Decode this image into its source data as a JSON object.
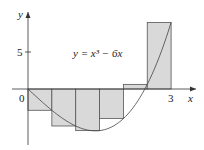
{
  "chart_data": {
    "type": "bar",
    "title": "",
    "subtitle": "Right-endpoint Riemann sum, n = 6",
    "function_label": "y = x³ − 6x",
    "xlabel": "x",
    "ylabel": "y",
    "x_ticks": [
      {
        "value": 0,
        "label": "0"
      },
      {
        "value": 3,
        "label": "3"
      }
    ],
    "y_ticks": [
      {
        "value": 5,
        "label": "5"
      }
    ],
    "xlim": [
      0,
      3
    ],
    "ylim": [
      -6,
      10
    ],
    "categories": [
      "0–0.5",
      "0.5–1",
      "1–1.5",
      "1.5–2",
      "2–2.5",
      "2.5–3"
    ],
    "x_left": [
      0,
      0.5,
      1,
      1.5,
      2,
      2.5
    ],
    "width": 0.5,
    "values": [
      -2.875,
      -5,
      -5.625,
      -4,
      0.625,
      9
    ],
    "curve": {
      "expr": "x^3 - 6x",
      "domain": [
        0,
        3
      ]
    },
    "colors": {
      "bar_fill": "#d9d9d9",
      "bar_stroke": "#555555",
      "curve": "#444444",
      "axis": "#333333"
    }
  }
}
